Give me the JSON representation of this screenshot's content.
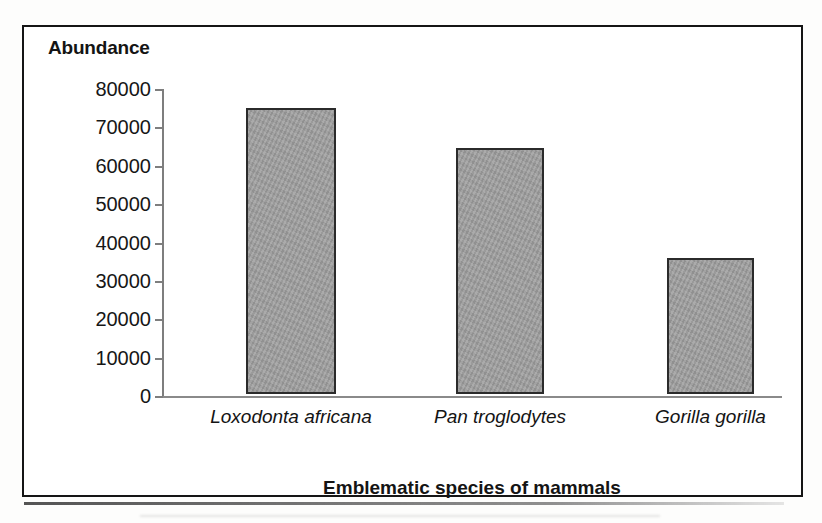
{
  "figure": {
    "frame_color": "#151515",
    "background_color": "#ffffff"
  },
  "chart_data": {
    "type": "bar",
    "title": "Abundance",
    "xlabel": "Emblematic species of mammals",
    "ylabel": "Abundance",
    "categories": [
      "Loxodonta africana",
      "Pan troglodytes",
      "Gorilla gorilla"
    ],
    "values": [
      74500,
      64000,
      35500
    ],
    "ylim": [
      0,
      80000
    ],
    "ytick_labels": [
      "80000",
      "70000",
      "60000",
      "50000",
      "40000",
      "30000",
      "20000",
      "10000",
      "0"
    ],
    "ytick_values": [
      80000,
      70000,
      60000,
      50000,
      40000,
      30000,
      20000,
      10000,
      0
    ],
    "ytick_step": 10000,
    "grid": false,
    "legend": null,
    "bar_fill_color": "#9c9c9c",
    "bar_edge_color": "#2b2b2b",
    "axis_color": "#7e7e7e",
    "xtick_label_style": "italic",
    "series": [
      {
        "name": "Abundance",
        "values": [
          74500,
          64000,
          35500
        ]
      }
    ]
  }
}
